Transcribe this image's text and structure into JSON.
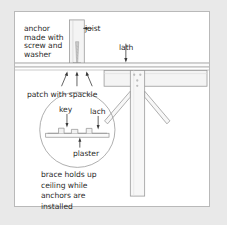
{
  "figure": {
    "border_color": "#b9b9b9",
    "background_color": "#ffffff",
    "page_background_color": "#e9e9e9",
    "ink_color": "#2b2b2b",
    "line_color": "#9a9a9a",
    "fill_color": "#f4f4f4"
  },
  "labels": {
    "anchor": "anchor\nmade with\nscrew and\nwasher",
    "joist": "joist",
    "lath": "lath",
    "patch": "patch with spackle",
    "caption": "brace holds up\nceiling while\nanchors are\ninstalled"
  },
  "detail_circle": {
    "key": "key",
    "lath": "lach",
    "plaster": "plaster"
  },
  "parts": {
    "joist": "vertical framing member",
    "anchor_screw": "screw with washer",
    "ceiling_lath": "horizontal lath layer",
    "plaster_layer": "plaster ceiling surface",
    "brace_top_plate": "horizontal brace plate",
    "brace_post": "vertical brace post",
    "brace_diagonal_left": "left diagonal brace",
    "brace_diagonal_right": "right diagonal brace",
    "fasteners": "screw heads"
  },
  "arrows": {
    "joist_arrow": "left-pointing arrow",
    "lath_arrow": "down-pointing arrow",
    "patch_arrows": "three up-pointing arrows",
    "key_arrow": "down-pointing arrow",
    "detail_lath_arrow": "down-pointing arrow",
    "plaster_arrow": "up-pointing arrow"
  }
}
